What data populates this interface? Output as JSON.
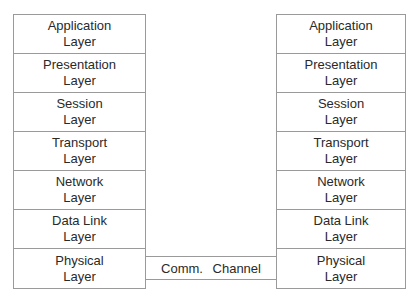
{
  "diagram": {
    "left_stack": {
      "layers": [
        {
          "name": "Application",
          "suffix": "Layer"
        },
        {
          "name": "Presentation",
          "suffix": "Layer"
        },
        {
          "name": "Session",
          "suffix": "Layer"
        },
        {
          "name": "Transport",
          "suffix": "Layer"
        },
        {
          "name": "Network",
          "suffix": "Layer"
        },
        {
          "name": "Data Link",
          "suffix": "Layer"
        },
        {
          "name": "Physical",
          "suffix": "Layer"
        }
      ]
    },
    "right_stack": {
      "layers": [
        {
          "name": "Application",
          "suffix": "Layer"
        },
        {
          "name": "Presentation",
          "suffix": "Layer"
        },
        {
          "name": "Session",
          "suffix": "Layer"
        },
        {
          "name": "Transport",
          "suffix": "Layer"
        },
        {
          "name": "Network",
          "suffix": "Layer"
        },
        {
          "name": "Data Link",
          "suffix": "Layer"
        },
        {
          "name": "Physical",
          "suffix": "Layer"
        }
      ]
    },
    "channel": {
      "label": "Comm. Channel"
    },
    "colors": {
      "line": "#9a9a9a",
      "text": "#2a2a2a",
      "background": "#ffffff"
    }
  }
}
